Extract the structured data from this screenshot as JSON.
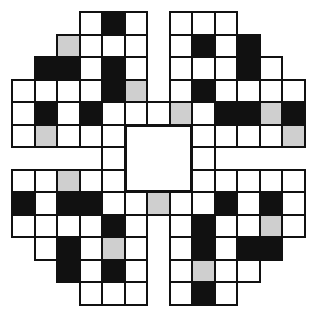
{
  "puzzle": {
    "type": "crossword-grid",
    "rows": 13,
    "cols": 13,
    "legend": {
      "W": "white-cell",
      "B": "black-cell",
      "G": "shaded-cell",
      ".": "no-cell"
    },
    "colors": {
      "white": "#ffffff",
      "black": "#111111",
      "shaded": "#cfcfcf",
      "border": "#111111"
    },
    "grid": [
      "...WBW.WWW...",
      "..GWWW.WBWB..",
      ".BBWBW.WWWBW.",
      "WWWWBG.WBWWWW",
      "WBWBWWWGWBBGB",
      "WGWWW...WWWWG",
      "....W...W....",
      "WWGWW...WWWWW",
      "BWBBWWGWWBWBW",
      "WWWWBW.WBWWGW",
      ".WBWGW.WBWBB.",
      "..BWBW.WGWW..",
      "...WWW.WBW..."
    ],
    "center_block": {
      "row": 5,
      "col": 5,
      "rows": 3,
      "cols": 3
    }
  }
}
